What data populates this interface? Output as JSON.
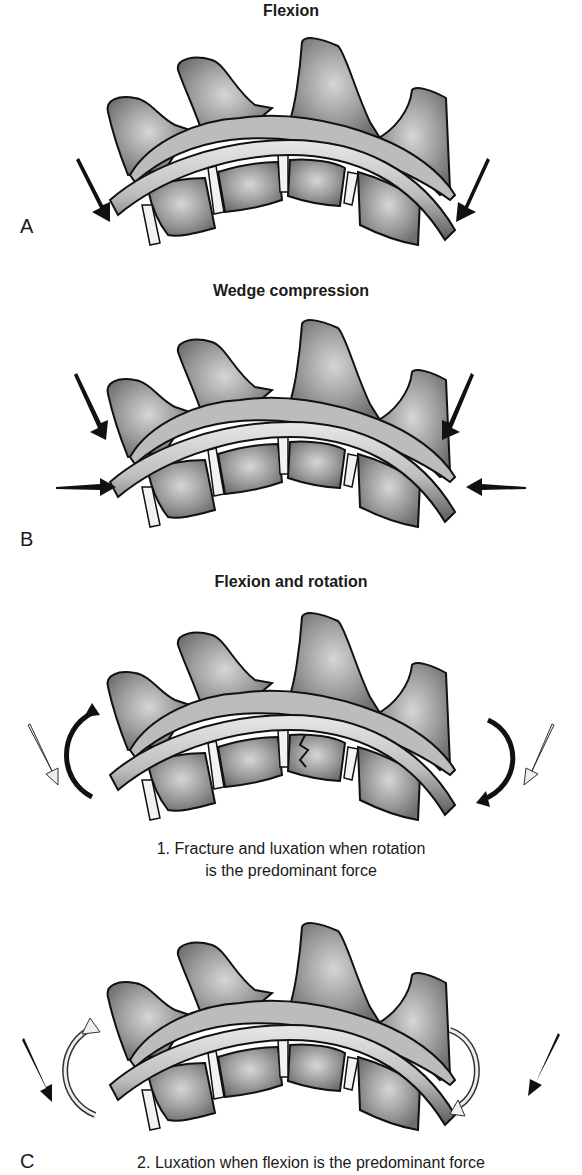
{
  "figure": {
    "panels": [
      {
        "letter": "A",
        "title": "Flexion",
        "forces": "two oblique arrows pressing down/inward at both ends"
      },
      {
        "letter": "B",
        "title": "Wedge compression",
        "forces": "two oblique arrows from above plus two horizontal arrows pressing inward"
      },
      {
        "letter": "",
        "title": "Flexion and rotation",
        "caption_line1": "1. Fracture and luxation when rotation",
        "caption_line2": "is the predominant force",
        "forces": "dark curved rotation arrows with light oblique arrows"
      },
      {
        "letter": "C",
        "title": "",
        "caption_line1": "2. Luxation when flexion is the predominant force",
        "forces": "light curved rotation arrows with dark oblique arrows"
      }
    ]
  },
  "colors": {
    "bone_fill": "#8a8a8a",
    "bone_light": "#c8c8c8",
    "outline": "#111111",
    "dark_arrow": "#111111",
    "light_arrow": "#e6e6e6"
  }
}
